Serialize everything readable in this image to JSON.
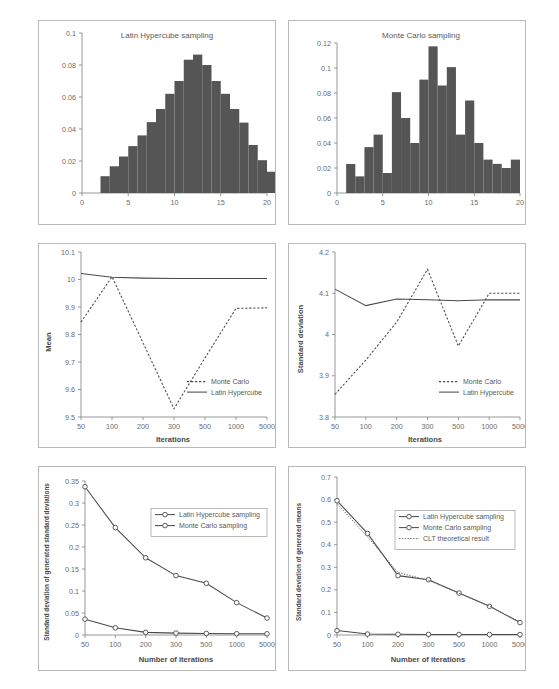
{
  "figure": {
    "caption": "",
    "panels": [
      "top-left",
      "top-right",
      "middle-left",
      "middle-right",
      "bottom-left",
      "bottom-right"
    ]
  },
  "chart_data": [
    {
      "id": "lhs-histogram",
      "type": "bar",
      "title": "Latin Hypercube sampling",
      "xlabel": "",
      "ylabel": "",
      "xlim": [
        0,
        20
      ],
      "ylim": [
        0,
        0.1
      ],
      "xticks": [
        0,
        5,
        10,
        15,
        20
      ],
      "xticklabels": [
        "0",
        "5",
        "10",
        "15",
        "20"
      ],
      "yticks": [
        0,
        0.02,
        0.04,
        0.06,
        0.08,
        0.1
      ],
      "yticklabels": [
        "0",
        "0.02",
        "0.04",
        "0.06",
        "0.08",
        "0.1"
      ],
      "grid": false,
      "bin_width": 1,
      "bin_starts": [
        2,
        3,
        4,
        5,
        6,
        7,
        8,
        9,
        10,
        11,
        12,
        13,
        14,
        15,
        16,
        17,
        18
      ],
      "values": [
        0.0105,
        0.0167,
        0.0228,
        0.0293,
        0.036,
        0.0443,
        0.0525,
        0.062,
        0.07,
        0.0833,
        0.0865,
        0.08,
        0.07,
        0.062,
        0.0525,
        0.044,
        0.03,
        0.0205,
        0.0133
      ]
    },
    {
      "id": "mc-histogram",
      "type": "bar",
      "title": "Monte Carlo sampling",
      "xlabel": "",
      "ylabel": "",
      "xlim": [
        0,
        20
      ],
      "ylim": [
        0,
        0.12
      ],
      "xticks": [
        0,
        5,
        10,
        15,
        20
      ],
      "xticklabels": [
        "0",
        "5",
        "10",
        "15",
        "20"
      ],
      "yticks": [
        0,
        0.02,
        0.04,
        0.06,
        0.08,
        0.1,
        0.12
      ],
      "yticklabels": [
        "0",
        "0.02",
        "0.04",
        "0.06",
        "0.08",
        "0.1",
        "0.12"
      ],
      "grid": false,
      "bin_width": 1,
      "bin_starts": [
        1,
        2,
        3,
        4,
        5,
        6,
        7,
        8,
        9,
        10,
        11,
        12,
        13,
        14,
        15,
        16,
        17,
        18,
        19
      ],
      "values": [
        0.0232,
        0.0133,
        0.0367,
        0.0467,
        0.016,
        0.0807,
        0.06,
        0.04,
        0.0907,
        0.1173,
        0.086,
        0.1007,
        0.0467,
        0.074,
        0.04,
        0.0267,
        0.0233,
        0.02,
        0.0267
      ]
    },
    {
      "id": "mean-convergence",
      "type": "line",
      "title": "",
      "xlabel": "Iterations",
      "ylabel": "Mean",
      "categories": [
        "50",
        "100",
        "200",
        "300",
        "500",
        "1000",
        "5000"
      ],
      "ylim": [
        9.5,
        10.1
      ],
      "yticks": [
        9.5,
        9.6,
        9.7,
        9.8,
        9.9,
        10.0,
        10.1
      ],
      "yticklabels": [
        "9.5",
        "9.6",
        "9.7",
        "9.8",
        "9.9",
        "10",
        "10.1"
      ],
      "grid": false,
      "legend_position": "lower right",
      "series": [
        {
          "name": "Monte Carlo",
          "style": "dashed",
          "values": [
            9.845,
            10.01,
            9.77,
            9.53,
            9.715,
            9.895,
            9.897
          ]
        },
        {
          "name": "Latin Hypercube",
          "style": "solid",
          "values": [
            10.022,
            10.008,
            10.005,
            10.004,
            10.004,
            10.004,
            10.004
          ]
        }
      ]
    },
    {
      "id": "stddev-convergence",
      "type": "line",
      "title": "",
      "xlabel": "Iterations",
      "ylabel": "Standard deviation",
      "categories": [
        "50",
        "100",
        "200",
        "300",
        "500",
        "1000",
        "5000"
      ],
      "ylim": [
        3.8,
        4.2
      ],
      "yticks": [
        3.8,
        3.9,
        4.0,
        4.1,
        4.2
      ],
      "yticklabels": [
        "3.8",
        "3.9",
        "4",
        "4.1",
        "4.2"
      ],
      "grid": false,
      "legend_position": "lower right",
      "series": [
        {
          "name": "Monte Carlo",
          "style": "dashed",
          "values": [
            3.855,
            3.938,
            4.03,
            4.158,
            3.972,
            4.1,
            4.1
          ]
        },
        {
          "name": "Latin Hypercube",
          "style": "solid",
          "values": [
            4.11,
            4.07,
            4.086,
            4.084,
            4.082,
            4.084,
            4.084
          ]
        }
      ]
    },
    {
      "id": "stddev-of-generated-stddevs",
      "type": "line",
      "title": "",
      "xlabel": "Number of iterations",
      "ylabel": "Standard deviation of generated standard deviations",
      "categories": [
        "50",
        "100",
        "200",
        "300",
        "500",
        "1000",
        "5000"
      ],
      "ylim": [
        0,
        0.35
      ],
      "yticks": [
        0,
        0.05,
        0.1,
        0.15,
        0.2,
        0.25,
        0.3,
        0.35
      ],
      "yticklabels": [
        "0",
        "0.05",
        "0.1",
        "0.15",
        "0.2",
        "0.25",
        "0.3",
        "0.35"
      ],
      "grid": false,
      "legend_position": "upper right",
      "series": [
        {
          "name": "Latin Hypercube sampling",
          "style": "solid-marker",
          "values": [
            0.036,
            0.0163,
            0.006,
            0.0043,
            0.0036,
            0.003,
            0.0028
          ]
        },
        {
          "name": "Monte Carlo sampling",
          "style": "solid-marker",
          "values": [
            0.337,
            0.244,
            0.1755,
            0.135,
            0.1175,
            0.0735,
            0.0385
          ]
        }
      ]
    },
    {
      "id": "stddev-of-generated-means",
      "type": "line",
      "title": "",
      "xlabel": "Number of iterations",
      "ylabel": "Standard deviation of generated means",
      "categories": [
        "50",
        "100",
        "200",
        "300",
        "500",
        "1000",
        "5000"
      ],
      "ylim": [
        0,
        0.7
      ],
      "yticks": [
        0,
        0.1,
        0.2,
        0.3,
        0.4,
        0.5,
        0.6,
        0.7
      ],
      "yticklabels": [
        "0",
        "0.1",
        "0.2",
        "0.3",
        "0.4",
        "0.5",
        "0.6",
        "0.7"
      ],
      "grid": false,
      "legend_position": "upper right",
      "series": [
        {
          "name": "Latin Hypercube sampling",
          "style": "solid-marker",
          "values": [
            0.0195,
            0.0042,
            0.003,
            0.0026,
            0.0022,
            0.002,
            0.0018
          ]
        },
        {
          "name": "Monte Carlo sampling",
          "style": "solid-marker",
          "values": [
            0.595,
            0.45,
            0.263,
            0.245,
            0.186,
            0.127,
            0.055
          ]
        },
        {
          "name": "CLT theoretical result",
          "style": "dotted",
          "values": [
            0.582,
            0.435,
            0.277,
            0.242,
            0.185,
            0.128,
            0.058
          ]
        }
      ]
    }
  ]
}
